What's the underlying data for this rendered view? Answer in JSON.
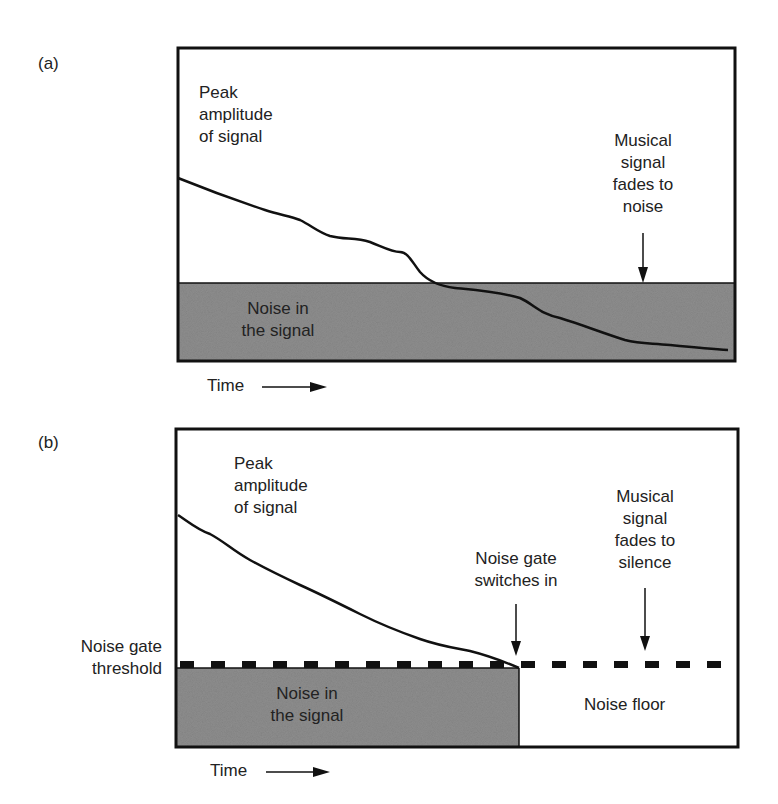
{
  "panels": {
    "a": {
      "label": "(a)",
      "peak_label": "Peak\namplitude\nof signal",
      "fade_label": "Musical\nsignal\nfades to\nnoise",
      "noise_label": "Noise in\nthe signal",
      "time_label": "Time"
    },
    "b": {
      "label": "(b)",
      "peak_label": "Peak\namplitude\nof signal",
      "gate_switch_label": "Noise gate\nswitches in",
      "fade_label": "Musical\nsignal\nfades to\nsilence",
      "noise_label": "Noise in\nthe signal",
      "noise_floor_label": "Noise floor",
      "threshold_label": "Noise gate\nthreshold",
      "time_label": "Time"
    }
  },
  "colors": {
    "noise_fill": "#8e8e8e",
    "line": "#111111"
  }
}
